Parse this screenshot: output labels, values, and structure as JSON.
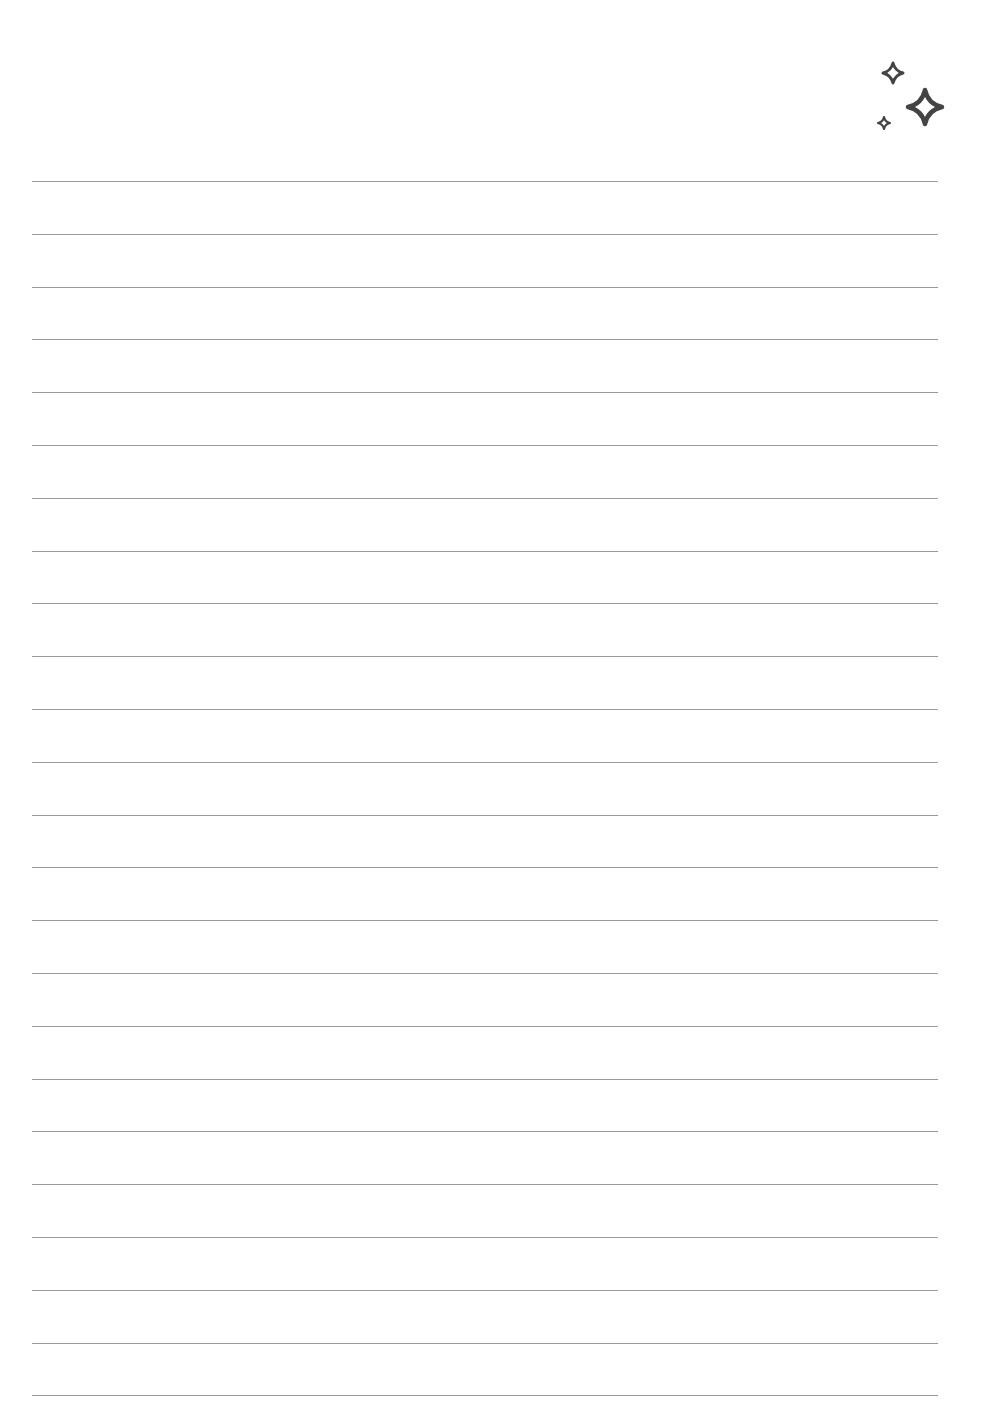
{
  "page": {
    "type": "lined-notebook-page",
    "background_color": "#ffffff",
    "line_color": "#9a9a9a",
    "line_count": 24,
    "first_line_y": 181,
    "line_spacing": 52.8
  },
  "decoration": {
    "icon": "sparkles-icon",
    "color": "#444444",
    "stars": [
      {
        "size": "medium",
        "cx": 893,
        "cy": 73
      },
      {
        "size": "large",
        "cx": 925,
        "cy": 107
      },
      {
        "size": "small",
        "cx": 884,
        "cy": 123
      }
    ]
  }
}
